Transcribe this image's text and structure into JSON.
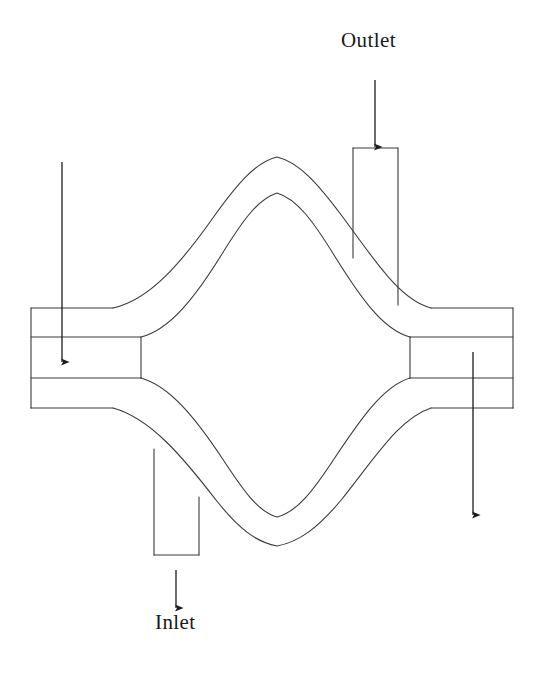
{
  "figure": {
    "type": "technical-line-diagram",
    "background_color": "#ffffff",
    "line_color": "#3a3a3a",
    "text_color": "#1a1a1a",
    "line_width": 1.1,
    "width": 538,
    "height": 673
  },
  "labels": {
    "outlet": "Outlet",
    "inlet": "Inlet"
  },
  "arrows": [
    {
      "name": "outlet-arrow",
      "label": "Outlet",
      "direction": "up",
      "x": 375,
      "from_y": 147,
      "to_y": 72
    },
    {
      "name": "left-branch-arrow",
      "label": "",
      "direction": "up",
      "x": 62,
      "from_y": 362,
      "to_y": 154
    },
    {
      "name": "right-branch-arrow",
      "label": "",
      "direction": "down",
      "x": 473,
      "from_y": 352,
      "to_y": 523
    },
    {
      "name": "inlet-arrow",
      "label": "Inlet",
      "direction": "up",
      "x": 176,
      "from_y": 608,
      "to_y": 562
    }
  ],
  "geometry": {
    "left_port": {
      "outer_left": 31,
      "outer_top": 308,
      "outer_bottom": 408,
      "inner_top": 337,
      "inner_bottom": 378,
      "outer_shoulder_x": 113,
      "inner_end_x": 141
    },
    "right_port": {
      "outer_right": 513,
      "outer_top": 308,
      "outer_bottom": 408,
      "inner_top": 337,
      "inner_bottom": 378,
      "outer_shoulder_x": 431,
      "inner_end_x": 410
    },
    "outlet_stub": {
      "left": 353,
      "right": 398,
      "top": 148,
      "bottom": 305
    },
    "inlet_stub": {
      "left": 154,
      "right": 199,
      "top": 408,
      "bottom": 555
    },
    "lens_outer": {
      "apex_top_y": 157,
      "apex_bottom_y": 546,
      "apex_x": 277
    },
    "lens_inner": {
      "apex_top_y": 193,
      "apex_bottom_y": 517,
      "apex_x": 277
    }
  }
}
